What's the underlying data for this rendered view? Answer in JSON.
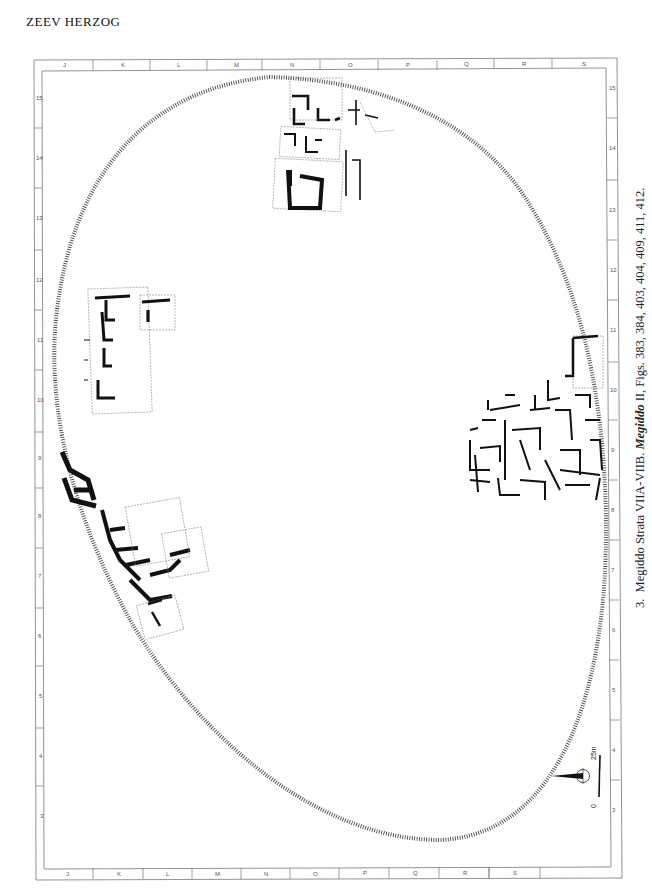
{
  "running_head": "ZEEV HERZOG",
  "figure": {
    "caption_number": "3.",
    "caption_pre": "Megiddo Strata VIIA-VIIB.",
    "caption_italic": "Megiddo",
    "caption_post": "II, Figs. 383, 384, 403, 404, 409, 411, 412.",
    "grid_letters": [
      "J",
      "K",
      "L",
      "M",
      "N",
      "O",
      "P",
      "Q",
      "R",
      "S"
    ],
    "grid_numbers": [
      "15",
      "14",
      "13",
      "12",
      "11",
      "10",
      "9",
      "8",
      "7",
      "6",
      "5",
      "4",
      "3"
    ],
    "scale_bar": {
      "start": "0",
      "end": "25m"
    },
    "north_arrow": "north-arrow"
  }
}
